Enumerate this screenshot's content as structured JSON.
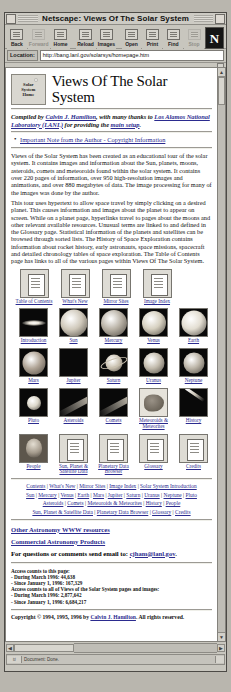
{
  "window": {
    "title": "Netscape: Views Of The Solar System"
  },
  "toolbar": {
    "buttons": [
      {
        "label": "Back",
        "icon": "back-icon",
        "enabled": true
      },
      {
        "label": "Forward",
        "icon": "forward-icon",
        "enabled": false
      },
      {
        "label": "Home",
        "icon": "home-icon",
        "enabled": true
      },
      {
        "label": "Reload",
        "icon": "reload-icon",
        "enabled": true
      },
      {
        "label": "Images",
        "icon": "images-icon",
        "enabled": true
      },
      {
        "label": "Open",
        "icon": "open-icon",
        "enabled": true
      },
      {
        "label": "Print",
        "icon": "print-icon",
        "enabled": true
      },
      {
        "label": "Find",
        "icon": "find-icon",
        "enabled": true
      },
      {
        "label": "Stop",
        "icon": "stop-icon",
        "enabled": false
      }
    ],
    "logo_letter": "N"
  },
  "location": {
    "label": "Location:",
    "value": "http://bang.lanl.gov/solarsys/homepage.htm"
  },
  "page": {
    "logo_lines": [
      "Solar",
      "System",
      "Home"
    ],
    "title": "Views Of The Solar System",
    "credit": {
      "prefix": "Compiled by ",
      "author": "Calvin J. Hamilton",
      "middle": ", with many thanks to ",
      "lab": "Los Alamos National Laboratory (LANL)",
      "suffix": " for providing the ",
      "link2": "main setup",
      "end": "."
    },
    "notice": {
      "text": "Important Note from the Author - Copyright Information"
    },
    "paragraph1": "Views of the Solar System has been created as an educational tour of the solar system. It contains images and information about the Sun, planets, moons, asteroids, comets and meteoroids found within the solar system. It contains over 220 pages of information, over 950 high-resolution images and animations, and over 880 megabytes of data. The image processing for many of the images was done by the author.",
    "paragraph2": "This tour uses hypertext to allow space travel by simply clicking on a desired planet. This causes information and images about the planet to appear on screen. While on a planet page, hyperlinks travel to pages about the moons and other relevant available resources. Unusual terms are linked to and defined in the Glossary page. Statistical information of the planets and satellites can be browsed through sorted lists. The History of Space Exploration contains information about rocket history, early astronauts, space missions, spacecraft and detailed chronology tables of space exploration. The Table of Contents page has links to all of the various pages within Views Of The Solar System.",
    "nav_icons": [
      {
        "label": "Table of Contents",
        "icon": "document-icon"
      },
      {
        "label": "What's New",
        "icon": "document-icon"
      },
      {
        "label": "Mirror Sites",
        "icon": "document-icon"
      },
      {
        "label": "Image Index",
        "icon": "document-icon"
      }
    ],
    "grid": [
      [
        {
          "label": "Introduction",
          "icon": "galaxy-thumb",
          "color": "#e9e4d8",
          "size": 22,
          "kind": "galaxy"
        },
        {
          "label": "Sun",
          "icon": "sun-thumb",
          "color": "#cfc8ba",
          "size": 27,
          "kind": "disk"
        },
        {
          "label": "Mercury",
          "icon": "mercury-thumb",
          "color": "#b9b2a6",
          "size": 26,
          "kind": "disk"
        },
        {
          "label": "Venus",
          "icon": "venus-thumb",
          "color": "#d6d0c0",
          "size": 24,
          "kind": "disk"
        },
        {
          "label": "Earth",
          "icon": "earth-thumb",
          "color": "#e3ded2",
          "size": 25,
          "kind": "disk"
        }
      ],
      [
        {
          "label": "Mars",
          "icon": "mars-thumb",
          "color": "#b0a496",
          "size": 23,
          "kind": "disk"
        },
        {
          "label": "Jupiter",
          "icon": "jupiter-thumb",
          "color": "#cdc4b4",
          "size": 24,
          "kind": "banded"
        },
        {
          "label": "Saturn",
          "icon": "saturn-thumb",
          "color": "#c9c0af",
          "size": 17,
          "kind": "ringed"
        },
        {
          "label": "Uranus",
          "icon": "uranus-thumb",
          "color": "#c3bcae",
          "size": 21,
          "kind": "disk"
        },
        {
          "label": "Neptune",
          "icon": "neptune-thumb",
          "color": "#bdb6a9",
          "size": 21,
          "kind": "disk"
        }
      ],
      [
        {
          "label": "Pluto",
          "icon": "pluto-thumb",
          "color": "#ddd8cb",
          "size": 14,
          "kind": "disk"
        },
        {
          "label": "Asteroids",
          "icon": "asteroids-thumb",
          "color": "#cdc6b8",
          "size": 0,
          "kind": "streak"
        },
        {
          "label": "Comets",
          "icon": "comets-thumb",
          "color": "#d4cdbe",
          "size": 0,
          "kind": "comet"
        },
        {
          "label": "Meteoroids & Meteorites",
          "icon": "meteorites-thumb",
          "color": "#bfb8ab",
          "size": 0,
          "kind": "rock"
        },
        {
          "label": "History",
          "icon": "history-thumb",
          "color": "#cbc4b6",
          "size": 0,
          "kind": "rocket"
        }
      ],
      [
        {
          "label": "People",
          "icon": "people-thumb",
          "color": "#b6aea1",
          "size": 0,
          "kind": "portrait"
        },
        {
          "label": "Sun, Planet & Satellite Data",
          "icon": "document-icon",
          "color": "",
          "size": 0,
          "kind": "doc"
        },
        {
          "label": "Planetary Data Browser",
          "icon": "document-icon",
          "color": "",
          "size": 0,
          "kind": "doc"
        },
        {
          "label": "Glossary",
          "icon": "document-icon",
          "color": "",
          "size": 0,
          "kind": "doc"
        },
        {
          "label": "Credits",
          "icon": "document-icon",
          "color": "",
          "size": 0,
          "kind": "doc"
        }
      ]
    ],
    "footer_links": [
      [
        "Contents",
        "What's New",
        "Mirror Sites",
        "Image Index",
        "Solar System Introduction"
      ],
      [
        "Sun",
        "Mercury",
        "Venus",
        "Earth",
        "Mars",
        "Jupiter",
        "Saturn",
        "Uranus",
        "Neptune",
        "Pluto"
      ],
      [
        "Asteroids",
        "Comets",
        "Meteoroids & Meteorites",
        "History",
        "People"
      ],
      [
        "Sun, Planet & Satellite Data",
        "Planetary Data Browser",
        "Glossary",
        "Credits"
      ]
    ],
    "other_resources": "Other Astronomy WWW resources",
    "commercial": "Commercial Astronomy Products",
    "contact": {
      "prefix": "For questions or comments send email to: ",
      "email": "cjham@lanl.gov",
      "suffix": "."
    },
    "stats": [
      "Access counts to this page:",
      "- During March 1996: 44,638",
      "- Since January 1, 1996: 167,329",
      "Access counts to all of Views of the Solar System pages and images:",
      "- During March 1996: 2,877,642",
      "- Since January 1, 1996: 6,684,217"
    ],
    "copyright": {
      "prefix": "Copyright © 1994, 1995, 1996 by ",
      "author": "Calvin J. Hamilton",
      "suffix": ". All rights reserved."
    }
  },
  "status": {
    "message": "Document: Done.",
    "key_glyph": "⌑"
  },
  "colors": {
    "link": "#2b2b8f",
    "chrome": "#c8c6be",
    "page_bg": "#ffffff"
  }
}
